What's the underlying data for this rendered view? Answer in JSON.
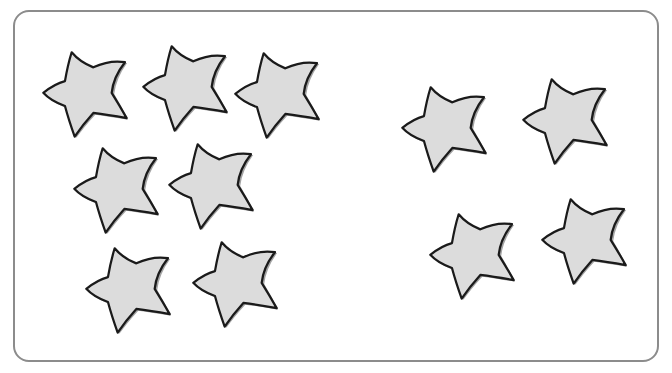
{
  "scene": {
    "description": "Two groups of star shapes inside a rounded rectangle frame",
    "frame": {
      "border_color": "#8c8c8c",
      "background": "#ffffff"
    },
    "star_style": {
      "fill": "#dcdcdc",
      "shade": "#a3a3a3",
      "outline": "#1a1a1a"
    },
    "groups": [
      {
        "name": "left-group",
        "count": 7,
        "stars": [
          {
            "x": 42,
            "y": 51,
            "size": 86
          },
          {
            "x": 142,
            "y": 45,
            "size": 86
          },
          {
            "x": 234,
            "y": 52,
            "size": 86
          },
          {
            "x": 73,
            "y": 147,
            "size": 86
          },
          {
            "x": 168,
            "y": 143,
            "size": 86
          },
          {
            "x": 85,
            "y": 247,
            "size": 86
          },
          {
            "x": 192,
            "y": 241,
            "size": 86
          }
        ]
      },
      {
        "name": "right-group",
        "count": 4,
        "stars": [
          {
            "x": 401,
            "y": 86,
            "size": 86
          },
          {
            "x": 522,
            "y": 78,
            "size": 86
          },
          {
            "x": 429,
            "y": 213,
            "size": 86
          },
          {
            "x": 541,
            "y": 198,
            "size": 86
          }
        ]
      }
    ],
    "total_stars": 11
  }
}
